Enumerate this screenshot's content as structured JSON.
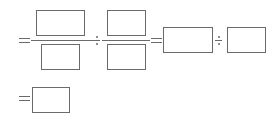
{
  "rows": [
    {
      "row": 1,
      "tokens": [
        "=",
        "fraction[blank/blank]",
        "÷",
        "fraction[blank/blank]",
        "=",
        "blank",
        "÷",
        "blank"
      ]
    },
    {
      "row": 2,
      "tokens": [
        "=",
        "blank"
      ]
    }
  ],
  "blanks": {
    "frac1_numerator": "",
    "frac1_denominator": "",
    "frac2_numerator": "",
    "frac2_denominator": "",
    "result_left": "",
    "result_right": "",
    "final_answer": ""
  },
  "symbols": {
    "equals": "=",
    "divide": "÷"
  },
  "colors": {
    "stroke": "#6a6a6a",
    "background": "#ffffff"
  }
}
